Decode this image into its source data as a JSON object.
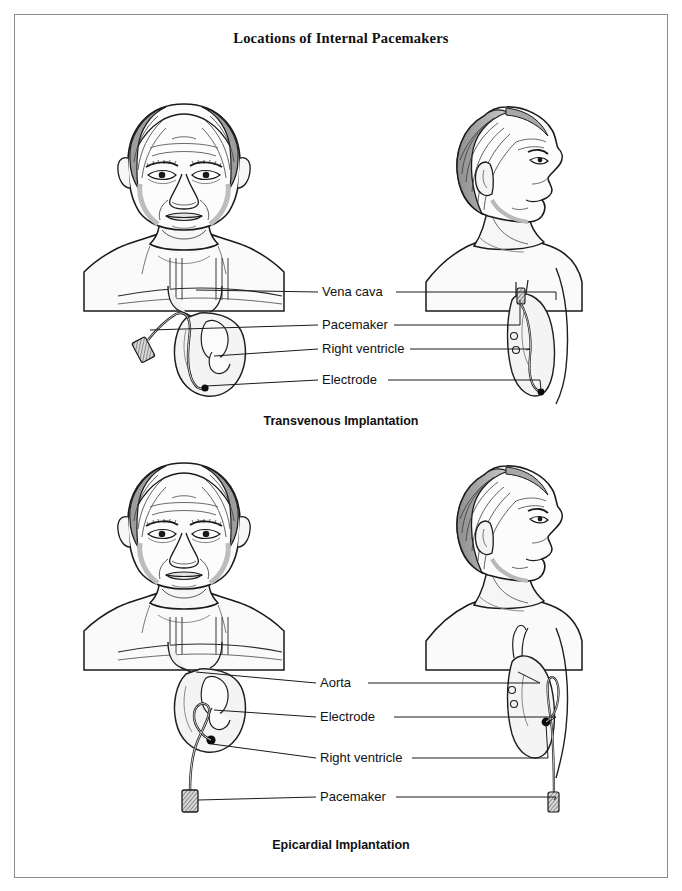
{
  "figure": {
    "title": "Locations of Internal Pacemakers",
    "type": "medical-illustration",
    "colors": {
      "ink": "#111111",
      "border": "#8d8d8d",
      "skin_shade": "#efefef",
      "hair_shade": "#9a9a9a",
      "background": "#ffffff"
    }
  },
  "panels": [
    {
      "id": "transvenous",
      "caption": "Transvenous Implantation",
      "views": [
        "anterior",
        "lateral"
      ],
      "labels": [
        {
          "text": "Vena cava",
          "y": 292
        },
        {
          "text": "Pacemaker",
          "y": 325
        },
        {
          "text": "Right ventricle",
          "y": 349
        },
        {
          "text": "Electrode",
          "y": 380
        }
      ]
    },
    {
      "id": "epicardial",
      "caption": "Epicardial Implantation",
      "views": [
        "anterior",
        "lateral"
      ],
      "labels": [
        {
          "text": "Aorta",
          "y": 683
        },
        {
          "text": "Electrode",
          "y": 717
        },
        {
          "text": "Right ventricle",
          "y": 758
        },
        {
          "text": "Pacemaker",
          "y": 797
        }
      ]
    }
  ]
}
